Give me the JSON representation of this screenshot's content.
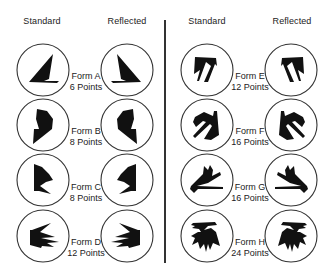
{
  "headers": {
    "left_standard": "Standard",
    "left_reflected": "Reflected",
    "right_standard": "Standard",
    "right_reflected": "Reflected"
  },
  "forms": [
    {
      "name": "Form A",
      "points": "6 Points"
    },
    {
      "name": "Form B",
      "points": "8 Points"
    },
    {
      "name": "Form C",
      "points": "8 Points"
    },
    {
      "name": "Form D",
      "points": "12 Points"
    },
    {
      "name": "Form E",
      "points": "12 Points"
    },
    {
      "name": "Form F",
      "points": "16 Points"
    },
    {
      "name": "Form G",
      "points": "16 Points"
    },
    {
      "name": "Form H",
      "points": "24 Points"
    }
  ],
  "icons": {
    "form_a": "random-polygon-6pt-icon",
    "form_b": "random-polygon-8pt-icon",
    "form_c": "random-polygon-8pt-icon",
    "form_d": "random-polygon-12pt-icon",
    "form_e": "random-polygon-12pt-icon",
    "form_f": "random-polygon-16pt-icon",
    "form_g": "random-polygon-16pt-icon",
    "form_h": "random-polygon-24pt-icon"
  },
  "colors": {
    "background": "#ffffff",
    "shape_fill": "#111111",
    "circle_stroke": "#333333",
    "text": "#222222"
  }
}
